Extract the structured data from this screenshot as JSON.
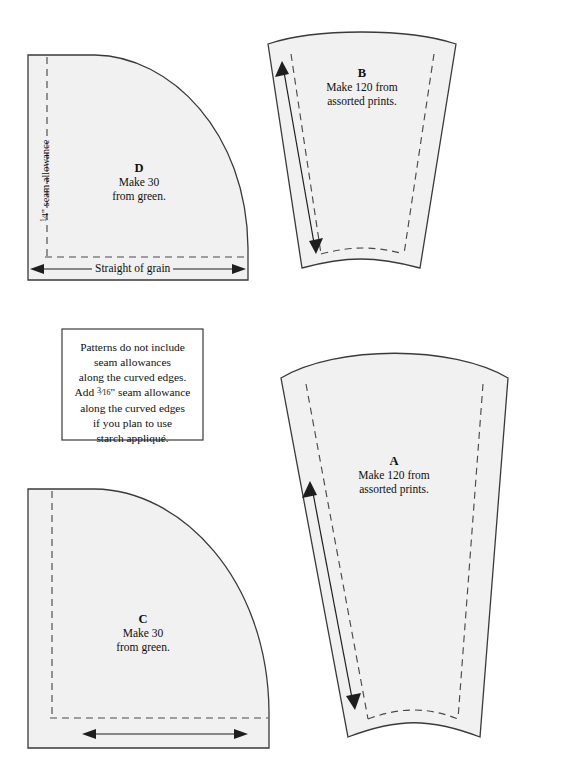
{
  "document": {
    "kind": "quilt-pattern-template-sheet",
    "background_color": "#ffffff",
    "piece_fill_color": "#f1f1f1",
    "outline_color": "#3a3a3a",
    "dashed_seam_color": "#4a4a4a"
  },
  "pieces": {
    "D": {
      "letter": "D",
      "line1": "Make 30",
      "line2": "from green.",
      "shape": "quarter-circle",
      "grain_label": "Straight of grain",
      "seam_allowance_label_prefix": "",
      "seam_allowance_numerator": "1",
      "seam_allowance_denominator": "4",
      "seam_allowance_suffix": "\" seam allowance"
    },
    "B": {
      "letter": "B",
      "line1": "Make 120 from",
      "line2": "assorted prints.",
      "shape": "wedge"
    },
    "C": {
      "letter": "C",
      "line1": "Make 30",
      "line2": "from green.",
      "shape": "quarter-circle"
    },
    "A": {
      "letter": "A",
      "line1": "Make 120 from",
      "line2": "assorted prints.",
      "shape": "wedge"
    }
  },
  "note": {
    "line1": "Patterns do not include",
    "line2": "seam allowances",
    "line3": "along the curved edges.",
    "line4_pre": "Add ",
    "line4_numerator": "3",
    "line4_denominator": "16",
    "line4_post": "\" seam allowance",
    "line5": "along the curved edges",
    "line6": "if you plan to use",
    "line7": "starch appliqué."
  }
}
